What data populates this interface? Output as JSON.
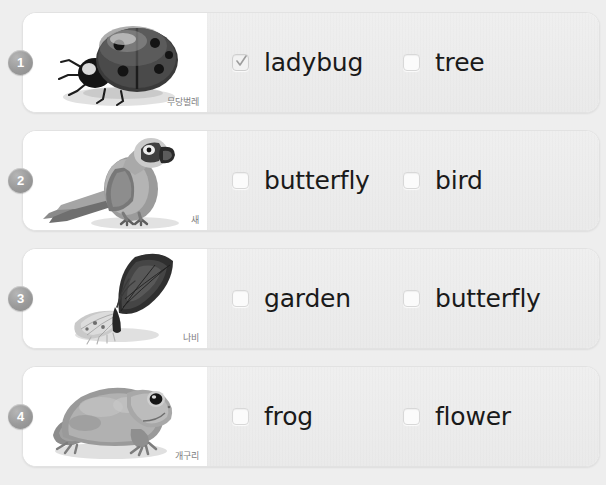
{
  "page": {
    "background_color": "#eeeeee",
    "card_color": "#ffffff",
    "answer_panel_color": "#ececec",
    "badge_color": "#9a9a9a",
    "text_color": "#1a1a1a"
  },
  "rows": [
    {
      "number": "1",
      "image": "ladybug-photo",
      "caption": "무당벌레",
      "options": [
        {
          "label": "ladybug",
          "checked": true,
          "checkbox_name": "checkbox-1-ladybug"
        },
        {
          "label": "tree",
          "checked": false,
          "checkbox_name": "checkbox-1-tree"
        }
      ]
    },
    {
      "number": "2",
      "image": "parrot-photo",
      "caption": "새",
      "options": [
        {
          "label": "butterfly",
          "checked": false,
          "checkbox_name": "checkbox-2-butterfly"
        },
        {
          "label": "bird",
          "checked": false,
          "checkbox_name": "checkbox-2-bird"
        }
      ]
    },
    {
      "number": "3",
      "image": "butterfly-photo",
      "caption": "나비",
      "options": [
        {
          "label": "garden",
          "checked": false,
          "checkbox_name": "checkbox-3-garden"
        },
        {
          "label": "butterfly",
          "checked": false,
          "checkbox_name": "checkbox-3-butterfly"
        }
      ]
    },
    {
      "number": "4",
      "image": "frog-photo",
      "caption": "개구리",
      "options": [
        {
          "label": "frog",
          "checked": false,
          "checkbox_name": "checkbox-4-frog"
        },
        {
          "label": "flower",
          "checked": false,
          "checkbox_name": "checkbox-4-flower"
        }
      ]
    }
  ]
}
